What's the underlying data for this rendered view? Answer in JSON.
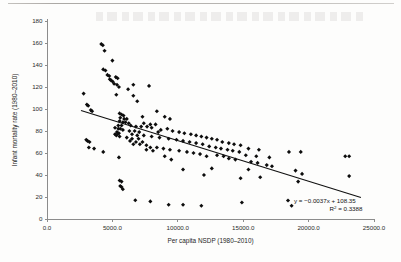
{
  "figure": {
    "background_color": "#fdfdfc",
    "marker_color": "#0d0d0d",
    "trendline_color": "#111111",
    "axis_color": "#8c8c8c"
  },
  "chart_data": {
    "type": "scatter",
    "title": "",
    "xlabel": "Per capita NSDP (1980–2010)",
    "ylabel": "Infant mortality rate (1980–2010)",
    "xlim": [
      0,
      25000
    ],
    "ylim": [
      0,
      180
    ],
    "xticks": [
      0,
      5000,
      10000,
      15000,
      20000,
      25000
    ],
    "xticklabels": [
      "0.0",
      "5000.0",
      "10000.0",
      "15000.0",
      "20000.0",
      "25000.0"
    ],
    "yticks": [
      0,
      20,
      40,
      60,
      80,
      100,
      120,
      140,
      160,
      180
    ],
    "yticklabels": [
      "0",
      "20",
      "40",
      "60",
      "80",
      "100",
      "120",
      "140",
      "160",
      "180"
    ],
    "grid": false,
    "legend": "none",
    "marker": "diamond",
    "annotations": [
      "y = −0.0037x + 108.35",
      "R² = 0.3388"
    ],
    "trendline": {
      "type": "linear",
      "slope": -0.0037,
      "intercept": 108.35,
      "r_squared": 0.3388,
      "x_start": 2600,
      "x_end": 24000,
      "y_start": 98.7,
      "y_end": 19.5
    },
    "points": [
      [
        4150,
        159
      ],
      [
        4270,
        158
      ],
      [
        4400,
        153
      ],
      [
        5000,
        144
      ],
      [
        4300,
        136
      ],
      [
        4470,
        135
      ],
      [
        4620,
        131
      ],
      [
        4760,
        130
      ],
      [
        4800,
        127
      ],
      [
        4900,
        126
      ],
      [
        5020,
        125
      ],
      [
        5130,
        123
      ],
      [
        5260,
        129
      ],
      [
        5400,
        128
      ],
      [
        5350,
        122
      ],
      [
        6600,
        122
      ],
      [
        7800,
        121
      ],
      [
        5500,
        120
      ],
      [
        6200,
        118
      ],
      [
        2800,
        114
      ],
      [
        5300,
        113
      ],
      [
        6600,
        112
      ],
      [
        6900,
        107
      ],
      [
        3050,
        104
      ],
      [
        3150,
        103
      ],
      [
        3350,
        99
      ],
      [
        3450,
        98
      ],
      [
        8400,
        98
      ],
      [
        5550,
        96
      ],
      [
        5700,
        95
      ],
      [
        5850,
        94
      ],
      [
        9000,
        93
      ],
      [
        7300,
        93
      ],
      [
        5600,
        92
      ],
      [
        5900,
        91
      ],
      [
        9400,
        91
      ],
      [
        6100,
        91
      ],
      [
        5550,
        89
      ],
      [
        5800,
        88
      ],
      [
        6000,
        88
      ],
      [
        6250,
        87
      ],
      [
        7400,
        87
      ],
      [
        7900,
        86
      ],
      [
        8300,
        86
      ],
      [
        5450,
        85
      ],
      [
        5700,
        85
      ],
      [
        6400,
        85
      ],
      [
        6800,
        84
      ],
      [
        7200,
        84
      ],
      [
        7650,
        84
      ],
      [
        8000,
        83
      ],
      [
        5200,
        83
      ],
      [
        5450,
        82
      ],
      [
        5600,
        82
      ],
      [
        5800,
        81
      ],
      [
        9200,
        82
      ],
      [
        8700,
        81
      ],
      [
        6300,
        80
      ],
      [
        6700,
        80
      ],
      [
        7050,
        79
      ],
      [
        5350,
        79
      ],
      [
        5500,
        78
      ],
      [
        8500,
        79
      ],
      [
        9600,
        80
      ],
      [
        10100,
        79
      ],
      [
        5200,
        77
      ],
      [
        5400,
        77
      ],
      [
        6500,
        77
      ],
      [
        6900,
        76
      ],
      [
        7400,
        76
      ],
      [
        10500,
        78
      ],
      [
        11000,
        77
      ],
      [
        5300,
        76
      ],
      [
        5550,
        75
      ],
      [
        8000,
        75
      ],
      [
        8600,
        74
      ],
      [
        11400,
        76
      ],
      [
        11800,
        75
      ],
      [
        12200,
        74
      ],
      [
        6100,
        74
      ],
      [
        6500,
        73
      ],
      [
        7000,
        73
      ],
      [
        9300,
        73
      ],
      [
        9900,
        72
      ],
      [
        12600,
        73
      ],
      [
        13000,
        72
      ],
      [
        6350,
        71
      ],
      [
        6800,
        70
      ],
      [
        7300,
        70
      ],
      [
        3000,
        72
      ],
      [
        3100,
        71
      ],
      [
        3250,
        70
      ],
      [
        10400,
        71
      ],
      [
        10900,
        70
      ],
      [
        13400,
        70
      ],
      [
        13900,
        69
      ],
      [
        6600,
        68
      ],
      [
        7100,
        68
      ],
      [
        7600,
        67
      ],
      [
        11400,
        69
      ],
      [
        11900,
        68
      ],
      [
        14300,
        68
      ],
      [
        14800,
        67
      ],
      [
        3200,
        65
      ],
      [
        3600,
        64
      ],
      [
        7900,
        65
      ],
      [
        8400,
        65
      ],
      [
        12400,
        66
      ],
      [
        12900,
        65
      ],
      [
        4300,
        61
      ],
      [
        8900,
        64
      ],
      [
        9400,
        63
      ],
      [
        13300,
        64
      ],
      [
        13800,
        63
      ],
      [
        15400,
        64
      ],
      [
        16200,
        63
      ],
      [
        7600,
        63
      ],
      [
        8100,
        62
      ],
      [
        10100,
        62
      ],
      [
        10700,
        61
      ],
      [
        14200,
        62
      ],
      [
        14700,
        61
      ],
      [
        18500,
        61
      ],
      [
        19400,
        61
      ],
      [
        22800,
        57
      ],
      [
        23100,
        57
      ],
      [
        5500,
        56
      ],
      [
        9000,
        57
      ],
      [
        11200,
        60
      ],
      [
        11700,
        59
      ],
      [
        13000,
        58
      ],
      [
        13500,
        57
      ],
      [
        15200,
        58
      ],
      [
        16000,
        57
      ],
      [
        17000,
        56
      ],
      [
        9500,
        54
      ],
      [
        12200,
        57
      ],
      [
        13900,
        55
      ],
      [
        14400,
        54
      ],
      [
        16800,
        49
      ],
      [
        17200,
        48
      ],
      [
        15600,
        52
      ],
      [
        16100,
        51
      ],
      [
        10400,
        45
      ],
      [
        15400,
        45
      ],
      [
        16300,
        38
      ],
      [
        12000,
        40
      ],
      [
        12600,
        46
      ],
      [
        19000,
        44
      ],
      [
        19500,
        41
      ],
      [
        23100,
        39
      ],
      [
        19200,
        34
      ],
      [
        14800,
        37
      ],
      [
        5550,
        35
      ],
      [
        5700,
        34
      ],
      [
        5600,
        30
      ],
      [
        5700,
        29
      ],
      [
        5800,
        27
      ],
      [
        6750,
        17
      ],
      [
        7900,
        16
      ],
      [
        9300,
        13
      ],
      [
        10400,
        13
      ],
      [
        11800,
        12
      ],
      [
        14900,
        15
      ],
      [
        18700,
        12
      ]
    ]
  },
  "equation": {
    "slope_text": "y = −0.0037x + 108.35",
    "r2_prefix": "R",
    "r2_sup": "2",
    "r2_value": " = 0.3388"
  }
}
